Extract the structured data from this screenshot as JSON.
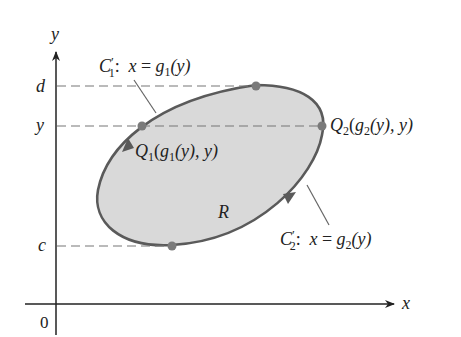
{
  "diagram": {
    "axes": {
      "x_label": "x",
      "y_label": "y",
      "origin_label": "0"
    },
    "y_ticks": {
      "d": "d",
      "y": "y",
      "c": "c"
    },
    "region_label": "R",
    "curves": {
      "c1": {
        "name_main": "C",
        "name_prime": "′",
        "name_sub": "1",
        "equation_prefix": ": ",
        "equation_var": "x",
        "equation_eq": " = ",
        "equation_func": "g",
        "equation_func_sub": "1",
        "equation_arg": "(y)"
      },
      "c2": {
        "name_main": "C",
        "name_prime": "′",
        "name_sub": "2",
        "equation_prefix": ": ",
        "equation_var": "x",
        "equation_eq": " = ",
        "equation_func": "g",
        "equation_func_sub": "2",
        "equation_arg": "(y)"
      }
    },
    "points": {
      "q1": {
        "name": "Q",
        "name_sub": "1",
        "coord_open": "(",
        "coord_func": "g",
        "coord_func_sub": "1",
        "coord_rest": "(y), y)"
      },
      "q2": {
        "name": "Q",
        "name_sub": "2",
        "coord_open": "(",
        "coord_func": "g",
        "coord_func_sub": "2",
        "coord_rest": "(y), y)"
      }
    },
    "colors": {
      "region_fill": "#d9d9d9",
      "boundary": "#5a5a5a",
      "point": "#7a7a7a",
      "axis": "#222222",
      "dashed": "#777777"
    }
  }
}
